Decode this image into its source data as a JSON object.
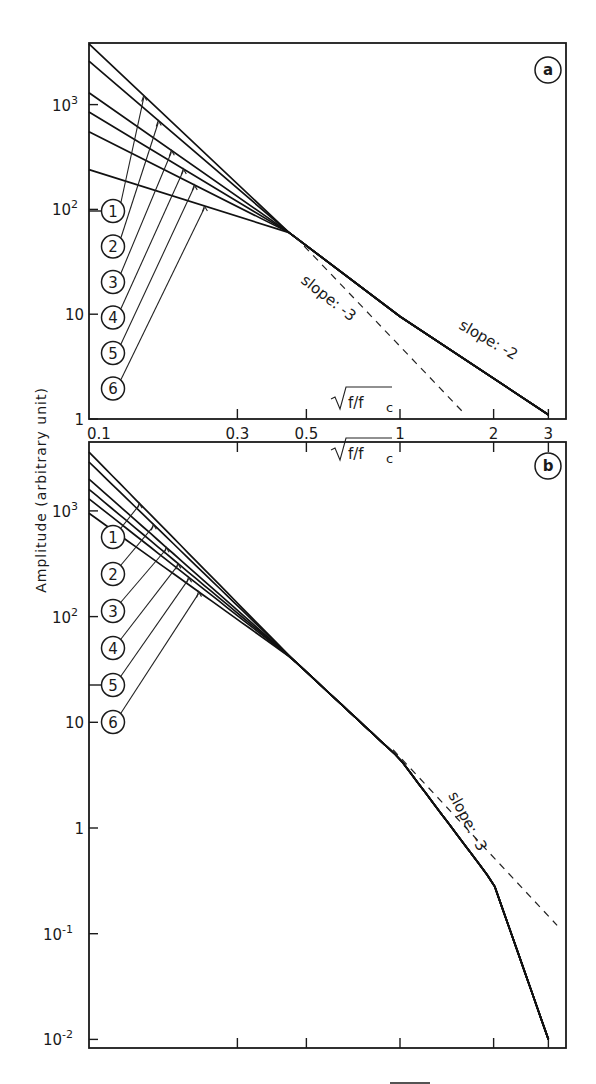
{
  "figure": {
    "ylabel": "Amplitude (arbitrary unit)",
    "xlabel": "√(f/fc)",
    "xlabel_radical": "f/f",
    "xlabel_sub": "c"
  },
  "chart_data": [
    {
      "panel": "a",
      "type": "line",
      "title": "a",
      "xscale": "log",
      "yscale": "log",
      "xlabel": "√(f/fc)",
      "ylabel": "Amplitude (arbitrary unit)",
      "xlim": [
        0.1,
        3.2
      ],
      "ylim": [
        1,
        4000
      ],
      "xticks": [
        0.1,
        0.3,
        0.5,
        1,
        2,
        3
      ],
      "xtick_labels": [
        "0.1",
        "0.3",
        "0.5",
        "1",
        "2",
        "3"
      ],
      "yticks": [
        1,
        10,
        100,
        1000
      ],
      "ytick_labels": [
        "1",
        "10",
        "10²",
        "10³"
      ],
      "legend": [
        "1",
        "2",
        "3",
        "4",
        "5",
        "6"
      ],
      "series": [
        {
          "name": "1",
          "x": [
            0.1,
            0.44,
            1.0,
            3.0
          ],
          "y": [
            3800,
            60,
            9.5,
            1.1
          ]
        },
        {
          "name": "2",
          "x": [
            0.1,
            0.44,
            1.0,
            3.0
          ],
          "y": [
            2600,
            60,
            9.5,
            1.1
          ]
        },
        {
          "name": "3",
          "x": [
            0.1,
            0.44,
            1.0,
            3.0
          ],
          "y": [
            1300,
            60,
            9.5,
            1.1
          ]
        },
        {
          "name": "4",
          "x": [
            0.1,
            0.44,
            1.0,
            3.0
          ],
          "y": [
            850,
            60,
            9.5,
            1.1
          ]
        },
        {
          "name": "5",
          "x": [
            0.1,
            0.44,
            1.0,
            3.0
          ],
          "y": [
            550,
            60,
            9.5,
            1.1
          ]
        },
        {
          "name": "6",
          "x": [
            0.1,
            0.44,
            1.0,
            3.0
          ],
          "y": [
            240,
            60,
            9.5,
            1.1
          ]
        }
      ],
      "reference_lines": [
        {
          "label": "slope: -3",
          "style": "dashed",
          "x": [
            0.46,
            1.6
          ],
          "y": [
            55,
            1.15
          ]
        },
        {
          "label": "slope: -2",
          "style": "solid",
          "x": [
            1.0,
            3.0
          ],
          "y": [
            9.5,
            1.1
          ]
        }
      ],
      "annotations": [
        "slope: -3",
        "slope: -2",
        "√(f/fc)"
      ]
    },
    {
      "panel": "b",
      "type": "line",
      "title": "b",
      "xscale": "log",
      "yscale": "log",
      "xlabel": "√(f/fc)",
      "ylabel": "Amplitude (arbitrary unit)",
      "xlim": [
        0.1,
        3.2
      ],
      "ylim": [
        0.008,
        4000
      ],
      "xticks": [
        0.1,
        0.3,
        0.5,
        1,
        2,
        3
      ],
      "yticks": [
        0.01,
        0.1,
        1,
        10,
        100,
        1000
      ],
      "ytick_labels": [
        "10⁻²",
        "10⁻¹",
        "1",
        "10",
        "10²",
        "10³"
      ],
      "legend": [
        "1",
        "2",
        "3",
        "4",
        "5",
        "6"
      ],
      "series": [
        {
          "name": "1",
          "x": [
            0.1,
            0.45,
            1.0,
            2.0,
            3.0
          ],
          "y": [
            3600,
            40,
            4.5,
            0.3,
            0.01
          ]
        },
        {
          "name": "2",
          "x": [
            0.1,
            0.45,
            1.0,
            2.0,
            3.0
          ],
          "y": [
            2900,
            40,
            4.5,
            0.3,
            0.01
          ]
        },
        {
          "name": "3",
          "x": [
            0.1,
            0.45,
            1.0,
            2.0,
            3.0
          ],
          "y": [
            2000,
            40,
            4.5,
            0.3,
            0.01
          ]
        },
        {
          "name": "4",
          "x": [
            0.1,
            0.45,
            1.0,
            2.0,
            3.0
          ],
          "y": [
            1600,
            40,
            4.5,
            0.3,
            0.01
          ]
        },
        {
          "name": "5",
          "x": [
            0.1,
            0.45,
            1.0,
            2.0,
            3.0
          ],
          "y": [
            1300,
            40,
            4.5,
            0.3,
            0.01
          ]
        },
        {
          "name": "6",
          "x": [
            0.1,
            0.45,
            1.0,
            2.0,
            3.0
          ],
          "y": [
            950,
            40,
            4.5,
            0.3,
            0.01
          ]
        }
      ],
      "reference_lines": [
        {
          "label": "slope: -3",
          "style": "dashed",
          "x": [
            0.95,
            3.2
          ],
          "y": [
            5.5,
            0.12
          ]
        }
      ],
      "annotations": [
        "slope: -3",
        "√(f/fc)"
      ]
    }
  ]
}
